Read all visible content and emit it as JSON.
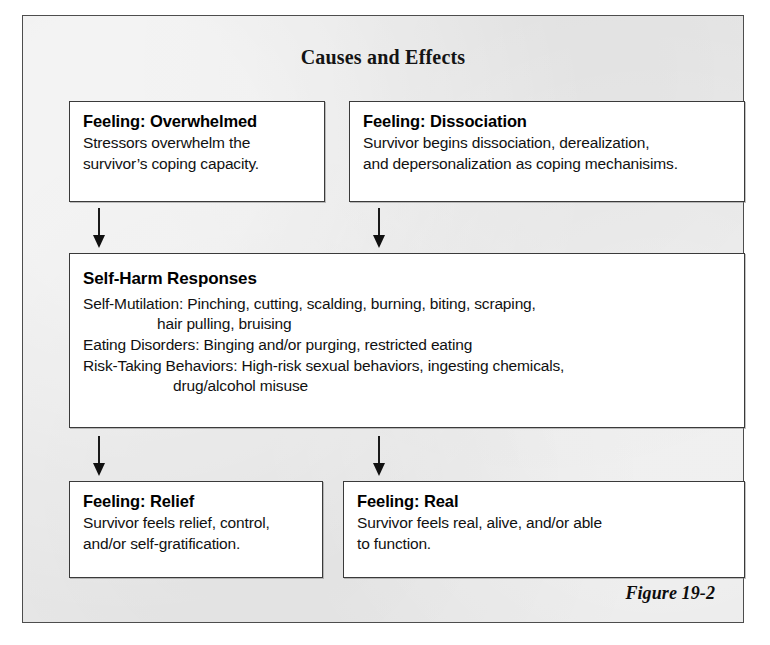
{
  "figure": {
    "title": "Causes and Effects",
    "caption": "Figure 19-2"
  },
  "nodes": {
    "overwhelmed": {
      "title": "Feeling: Overwhelmed",
      "lines": [
        "Stressors overwhelm the",
        "survivor’s coping capacity."
      ]
    },
    "dissociation": {
      "title": "Feeling: Dissociation",
      "lines": [
        "Survivor begins dissociation, derealization,",
        "and depersonalization as coping mechanisims."
      ]
    },
    "self_harm": {
      "title": "Self-Harm Responses",
      "lines": [
        "Self-Mutilation: Pinching, cutting, scalding, burning, biting, scraping,",
        "hair pulling, bruising",
        "Eating Disorders: Binging and/or purging, restricted eating",
        "Risk-Taking Behaviors: High-risk sexual behaviors, ingesting chemicals,",
        "drug/alcohol misuse"
      ]
    },
    "relief": {
      "title": "Feeling: Relief",
      "lines": [
        "Survivor feels relief, control,",
        "and/or self-gratification."
      ]
    },
    "real": {
      "title": "Feeling: Real",
      "lines": [
        "Survivor feels real, alive, and/or able",
        "to function."
      ]
    }
  },
  "chart_data": {
    "type": "diagram",
    "title": "Causes and Effects",
    "caption": "Figure 19-2",
    "diagram_kind": "flowchart",
    "direction": "top-to-bottom",
    "nodes": [
      {
        "id": "overwhelmed",
        "label": "Feeling: Overwhelmed",
        "body": "Stressors overwhelm the survivor’s coping capacity.",
        "row": 1,
        "column": "left"
      },
      {
        "id": "dissociation",
        "label": "Feeling: Dissociation",
        "body": "Survivor begins dissociation, derealization, and depersonalization as coping mechanisims.",
        "row": 1,
        "column": "right"
      },
      {
        "id": "self_harm",
        "label": "Self-Harm Responses",
        "body": "Self-Mutilation: Pinching, cutting, scalding, burning, biting, scraping, hair pulling, bruising | Eating Disorders: Binging and/or purging, restricted eating | Risk-Taking Behaviors: High-risk sexual behaviors, ingesting chemicals, drug/alcohol misuse",
        "row": 2,
        "column": "full"
      },
      {
        "id": "relief",
        "label": "Feeling: Relief",
        "body": "Survivor feels relief, control, and/or self-gratification.",
        "row": 3,
        "column": "left"
      },
      {
        "id": "real",
        "label": "Feeling: Real",
        "body": "Survivor feels real, alive, and/or able to function.",
        "row": 3,
        "column": "right"
      }
    ],
    "edges": [
      {
        "from": "overwhelmed",
        "to": "self_harm",
        "style": "solid-arrow-down"
      },
      {
        "from": "dissociation",
        "to": "self_harm",
        "style": "solid-arrow-down"
      },
      {
        "from": "self_harm",
        "to": "relief",
        "style": "solid-arrow-down"
      },
      {
        "from": "self_harm",
        "to": "real",
        "style": "solid-arrow-down"
      }
    ],
    "colors": {
      "panel_background": "#e9e9e9",
      "box_background": "#ffffff",
      "border": "#3a3a3a",
      "text": "#111111"
    }
  }
}
